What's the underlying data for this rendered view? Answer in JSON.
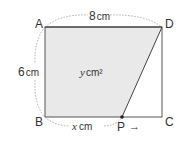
{
  "figure": {
    "type": "geometry-diagram",
    "shape": "rectangle ABCD with moving point P on BC",
    "points": {
      "A": "A",
      "B": "B",
      "C": "C",
      "D": "D",
      "P": "P"
    },
    "measurements": {
      "top": "8",
      "top_unit": "cm",
      "left": "6",
      "left_unit": "cm",
      "bottom_var": "x",
      "bottom_unit": "cm",
      "area_var": "y",
      "area_unit": "cm²"
    },
    "colors": {
      "shaded_fill": "#e9e9e9",
      "stroke": "#444444",
      "dotted": "#888888"
    },
    "p_direction": "→"
  }
}
